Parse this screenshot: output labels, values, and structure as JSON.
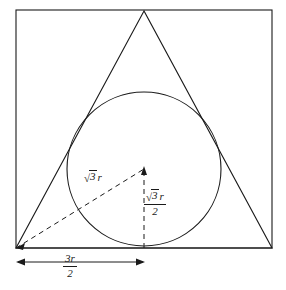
{
  "figure": {
    "background_color": "#ffffff",
    "stroke_color": "#1a1a1a",
    "labels": {
      "diagonal": {
        "name": "sqrt-3-r",
        "radical_sign": "√",
        "radicand": "3",
        "multiplier": "r",
        "plain": "√3 r"
      },
      "vertical": {
        "name": "sqrt-3-r-over-2",
        "radical_sign": "√",
        "radicand": "3",
        "multiplier": "r",
        "denominator": "2",
        "plain": "√3 r / 2"
      },
      "base": {
        "name": "three-r-over-2",
        "numerator": "3r",
        "numerator_coefficient": "3",
        "numerator_variable": "r",
        "denominator": "2",
        "plain": "3r / 2"
      }
    },
    "geometry": {
      "square": {
        "x": 16,
        "y": 10,
        "width": 256,
        "height": 238
      },
      "triangle": {
        "apex": [
          144,
          11
        ],
        "bottom_left": [
          16,
          248
        ],
        "bottom_right": [
          272,
          248
        ]
      },
      "circle": {
        "cx": 144,
        "cy": 169,
        "r": 77
      },
      "diagonal_dashed": {
        "from": [
          16,
          248
        ],
        "to": [
          144,
          169
        ]
      },
      "vertical_dashed": {
        "from": [
          144,
          248
        ],
        "to": [
          144,
          169
        ]
      },
      "dimension_line": {
        "from": [
          16,
          262
        ],
        "to": [
          145,
          262
        ]
      }
    }
  }
}
